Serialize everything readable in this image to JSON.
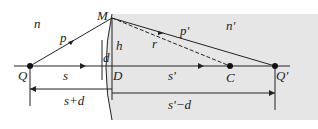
{
  "diagram": {
    "type": "optics-refraction-spherical-surface",
    "labels": {
      "n": "n",
      "n_prime": "n'",
      "M": "M",
      "p": "p",
      "p_prime": "p'",
      "r": "r",
      "h": "h",
      "d": "d",
      "D": "D",
      "Q": "Q",
      "Q_prime": "Q'",
      "C": "C",
      "s": "s",
      "s_prime": "s'",
      "s_plus_d": "s+d",
      "s_prime_minus_d": "s'−d"
    },
    "colors": {
      "medium_fill": "#e6e6e6",
      "line": "#222222"
    }
  }
}
